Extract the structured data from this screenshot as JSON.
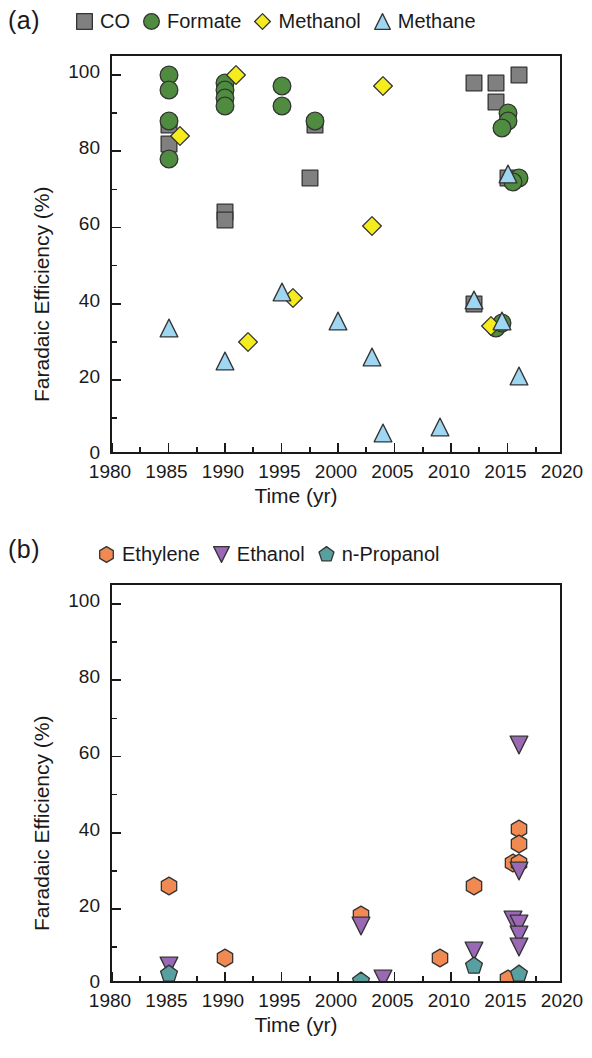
{
  "panel_a": {
    "label": "(a)",
    "legend": [
      {
        "name": "CO",
        "icon": "square-marker-icon",
        "color": "#808080"
      },
      {
        "name": "Formate",
        "icon": "circle-marker-icon",
        "color": "#4f8c3f"
      },
      {
        "name": "Methanol",
        "icon": "diamond-marker-icon",
        "color": "#f5ec1e"
      },
      {
        "name": "Methane",
        "icon": "triangle-marker-icon",
        "color": "#9fd6f2"
      }
    ]
  },
  "panel_b": {
    "label": "(b)",
    "legend": [
      {
        "name": "Ethylene",
        "icon": "hexagon-marker-icon",
        "color": "#f08a52"
      },
      {
        "name": "Ethanol",
        "icon": "down-triangle-marker-icon",
        "color": "#9b68b5"
      },
      {
        "name": "n-Propanol",
        "icon": "pentagon-marker-icon",
        "color": "#58a0a0"
      }
    ]
  },
  "chart_data": [
    {
      "type": "scatter",
      "panel": "(a)",
      "title": "",
      "xlabel": "Time (yr)",
      "ylabel": "Faradaic Efficiency (%)",
      "xlim": [
        1980,
        2020
      ],
      "ylim": [
        0,
        105
      ],
      "xticks": [
        1980,
        1985,
        1990,
        1995,
        2000,
        2005,
        2010,
        2015,
        2020
      ],
      "yticks": [
        0,
        20,
        40,
        60,
        80,
        100
      ],
      "x_minor_interval": 2.5,
      "y_minor_interval": 10,
      "grid": false,
      "legend_position": "above-plot",
      "series": [
        {
          "name": "CO",
          "marker": "square",
          "color": "#808080",
          "points": [
            [
              1985,
              87
            ],
            [
              1985,
              82
            ],
            [
              1990,
              64
            ],
            [
              1990,
              62
            ],
            [
              1997.5,
              73
            ],
            [
              1998,
              87
            ],
            [
              2012,
              98
            ],
            [
              2014,
              98
            ],
            [
              2014,
              93
            ],
            [
              2016,
              100
            ],
            [
              2015,
              73
            ],
            [
              2012,
              40
            ]
          ]
        },
        {
          "name": "Formate",
          "marker": "circle",
          "color": "#4f8c3f",
          "points": [
            [
              1985,
              100
            ],
            [
              1985,
              96
            ],
            [
              1985,
              88
            ],
            [
              1985,
              78
            ],
            [
              1990,
              98
            ],
            [
              1990,
              96
            ],
            [
              1990,
              94
            ],
            [
              1990,
              92
            ],
            [
              1995,
              97
            ],
            [
              1995,
              92
            ],
            [
              1998,
              88
            ],
            [
              2015,
              90
            ],
            [
              2015,
              88
            ],
            [
              2014.5,
              86
            ],
            [
              2016,
              73
            ],
            [
              2015.5,
              72
            ],
            [
              2014,
              33.5
            ],
            [
              2014.5,
              35
            ]
          ]
        },
        {
          "name": "Methanol",
          "marker": "diamond",
          "color": "#f5ec1e",
          "points": [
            [
              1986,
              84
            ],
            [
              1991,
              100
            ],
            [
              1992,
              30
            ],
            [
              1996,
              41.5
            ],
            [
              2003,
              60.5
            ],
            [
              2004,
              97
            ],
            [
              2013.5,
              34
            ]
          ]
        },
        {
          "name": "Methane",
          "marker": "triangle",
          "color": "#9fd6f2",
          "points": [
            [
              1985,
              33.5
            ],
            [
              1990,
              25
            ],
            [
              1995,
              43
            ],
            [
              2000,
              35.5
            ],
            [
              2003,
              26
            ],
            [
              2004,
              6
            ],
            [
              2009,
              7.5
            ],
            [
              2012,
              41
            ],
            [
              2015,
              74
            ],
            [
              2014.5,
              35.5
            ],
            [
              2016,
              21
            ]
          ]
        }
      ]
    },
    {
      "type": "scatter",
      "panel": "(b)",
      "title": "",
      "xlabel": "Time (yr)",
      "ylabel": "Faradaic Efficiency (%)",
      "xlim": [
        1980,
        2020
      ],
      "ylim": [
        0,
        105
      ],
      "xticks": [
        1980,
        1985,
        1990,
        1995,
        2000,
        2005,
        2010,
        2015,
        2020
      ],
      "yticks": [
        0,
        20,
        40,
        60,
        80,
        100
      ],
      "x_minor_interval": 2.5,
      "y_minor_interval": 10,
      "grid": false,
      "legend_position": "above-plot",
      "series": [
        {
          "name": "Ethylene",
          "marker": "hexagon",
          "color": "#f08a52",
          "points": [
            [
              1985,
              26
            ],
            [
              1990,
              7
            ],
            [
              2002,
              18.5
            ],
            [
              2009,
              7
            ],
            [
              2012,
              26
            ],
            [
              2015,
              1.5
            ],
            [
              2015.5,
              32
            ],
            [
              2016,
              41
            ],
            [
              2016,
              37
            ],
            [
              2016,
              32
            ]
          ]
        },
        {
          "name": "Ethanol",
          "marker": "down-triangle",
          "color": "#9b68b5",
          "points": [
            [
              1985,
              5
            ],
            [
              2002,
              15.5
            ],
            [
              2004,
              1.5
            ],
            [
              2012,
              9
            ],
            [
              2015.5,
              17
            ],
            [
              2016,
              63
            ],
            [
              2016,
              30
            ],
            [
              2016,
              16
            ],
            [
              2016,
              13
            ],
            [
              2016,
              10
            ]
          ]
        },
        {
          "name": "n-Propanol",
          "marker": "pentagon",
          "color": "#58a0a0",
          "points": [
            [
              1985,
              3
            ],
            [
              2002,
              1
            ],
            [
              2012,
              5
            ],
            [
              2016,
              3
            ]
          ]
        }
      ]
    }
  ]
}
